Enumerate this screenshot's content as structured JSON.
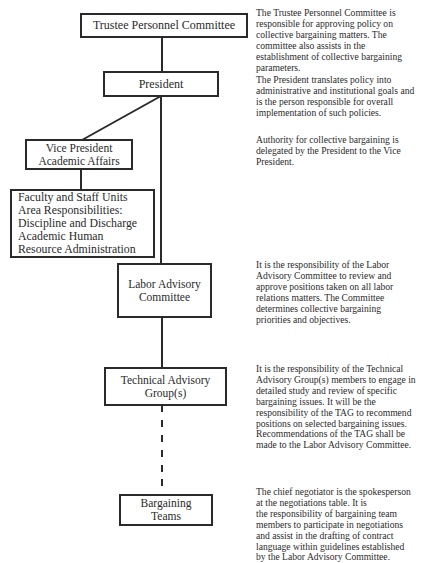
{
  "diagram": {
    "type": "organizational-chart",
    "nodes": [
      {
        "id": "trustee",
        "lines": [
          "Trustee Personnel Committee"
        ]
      },
      {
        "id": "president",
        "lines": [
          "President"
        ]
      },
      {
        "id": "vp",
        "lines": [
          "Vice President",
          "Academic Affairs"
        ]
      },
      {
        "id": "faculty",
        "lines": [
          "Faculty and Staff Units",
          "Area Responsibilities:",
          "Discipline and Discharge",
          "Academic Human",
          "Resource Administration"
        ]
      },
      {
        "id": "labor",
        "lines": [
          "Labor Advisory",
          "Committee"
        ]
      },
      {
        "id": "technical",
        "lines": [
          "Technical Advisory",
          "Group(s)"
        ]
      },
      {
        "id": "bargaining",
        "lines": [
          "Bargaining",
          "Teams"
        ]
      }
    ],
    "edges": [
      {
        "from": "trustee",
        "to": "president",
        "style": "solid"
      },
      {
        "from": "president",
        "to": "vp",
        "style": "solid-diagonal"
      },
      {
        "from": "vp",
        "to": "faculty",
        "style": "solid"
      },
      {
        "from": "president",
        "to": "labor",
        "style": "solid"
      },
      {
        "from": "labor",
        "to": "technical",
        "style": "solid"
      },
      {
        "from": "technical",
        "to": "bargaining",
        "style": "dashed"
      }
    ],
    "descriptions": [
      {
        "node": "trustee",
        "lines": [
          "The Trustee Personnel Committee is",
          "responsible for approving policy on",
          "collective bargaining matters. The",
          "committee also assists in the",
          "establishment of collective bargaining",
          "parameters."
        ]
      },
      {
        "node": "president",
        "lines": [
          "The President translates policy into",
          "administrative and institutional goals and",
          "is the person responsible for overall",
          "implementation of such policies."
        ]
      },
      {
        "node": "vp",
        "lines": [
          "Authority for collective bargaining is",
          "delegated by the President to the Vice",
          "President."
        ]
      },
      {
        "node": "labor",
        "lines": [
          "It is the responsibility of the Labor",
          "Advisory Committee to review and",
          "approve positions taken on all labor",
          "relations matters. The Committee",
          "determines collective bargaining",
          "priorities and objectives."
        ]
      },
      {
        "node": "technical",
        "lines": [
          "It is the responsibility of the Technical",
          "Advisory Group(s) members to engage in",
          "detailed study and review of specific",
          "bargaining issues. It will be the",
          "responsibility of the TAG to recommend",
          "positions on selected bargaining issues.",
          "Recommendations of the TAG shall be",
          "made to the Labor Advisory Committee."
        ]
      },
      {
        "node": "bargaining",
        "lines": [
          "The chief negotiator is the spokesperson",
          "at the negotiations table. It is",
          "the responsibility of bargaining team",
          "members to participate in negotiations",
          "and assist in the drafting of contract",
          "language within guidelines established",
          "by the Labor Advisory Committee."
        ]
      }
    ]
  },
  "colors": {
    "line": "#2a2a2a",
    "text": "#2b2b2b",
    "background": "#ffffff"
  }
}
